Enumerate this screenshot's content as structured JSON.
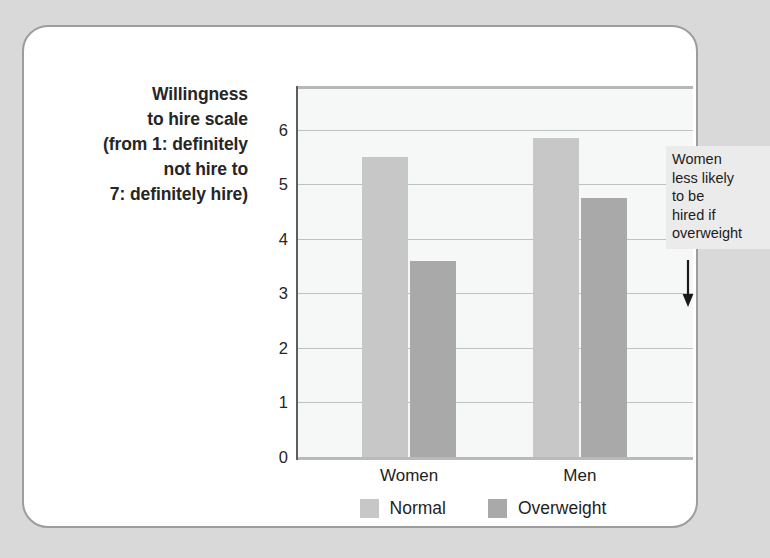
{
  "figure": {
    "frame_color": "#d9d9d9",
    "card_background": "#ffffff",
    "card_border_color": "#9d9d9d"
  },
  "axis_title_lines": [
    "Willingness",
    "to hire scale",
    "(from 1: definitely",
    "not hire to",
    "7: definitely hire)"
  ],
  "annotation": {
    "lines": [
      "Women",
      "less likely",
      "to be",
      "hired if",
      "overweight"
    ],
    "background": "#ebebeb",
    "arrow": "down-arrow"
  },
  "chart_data": {
    "type": "bar",
    "title": "",
    "subtitle": "",
    "xlabel": "",
    "ylabel": "Willingness to hire scale (from 1: definitely not hire to 7: definitely hire)",
    "categories": [
      "Women",
      "Men"
    ],
    "series": [
      {
        "name": "Normal",
        "values": [
          5.5,
          5.85
        ],
        "color": "#c7c7c7"
      },
      {
        "name": "Overweight",
        "values": [
          3.6,
          4.75
        ],
        "color": "#a9a9a9"
      }
    ],
    "ylim": [
      0,
      6.75
    ],
    "yticks": [
      0,
      1,
      2,
      3,
      4,
      5,
      6
    ],
    "ytick_labels": [
      "0",
      "1",
      "2",
      "3",
      "4",
      "5",
      "6"
    ],
    "grid": true,
    "grid_axis": "y",
    "legend": true,
    "legend_position": "bottom",
    "legend_entries": [
      "Normal",
      "Overweight"
    ],
    "plot_background": "#f6f7f7",
    "annotations": [
      {
        "text": "Women less likely to be hired if overweight",
        "points_to": {
          "category": "Women",
          "series": "Overweight",
          "value": 3.6
        }
      }
    ]
  }
}
